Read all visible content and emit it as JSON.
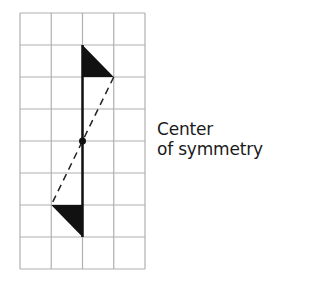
{
  "diagram": {
    "type": "point-symmetry-grid",
    "grid": {
      "columns": 4,
      "rows": 8,
      "left": 20,
      "top": 13,
      "cell_width": 31.25,
      "cell_height": 32,
      "line_color": "#b0b0b0"
    },
    "figure_color": "#111111",
    "center_point": {
      "x": 82.5,
      "y": 141
    },
    "top_triangle": [
      [
        82.5,
        45
      ],
      [
        82.5,
        77
      ],
      [
        113.75,
        77
      ]
    ],
    "bottom_triangle": [
      [
        82.5,
        237
      ],
      [
        82.5,
        205
      ],
      [
        51.25,
        205
      ]
    ],
    "solid_segment": {
      "x1": 82.5,
      "y1": 45,
      "x2": 82.5,
      "y2": 237
    },
    "dashed_segment": {
      "x1": 113.75,
      "y1": 77,
      "x2": 51.25,
      "y2": 205
    }
  },
  "label": {
    "line1": "Center",
    "line2": "of symmetry"
  }
}
